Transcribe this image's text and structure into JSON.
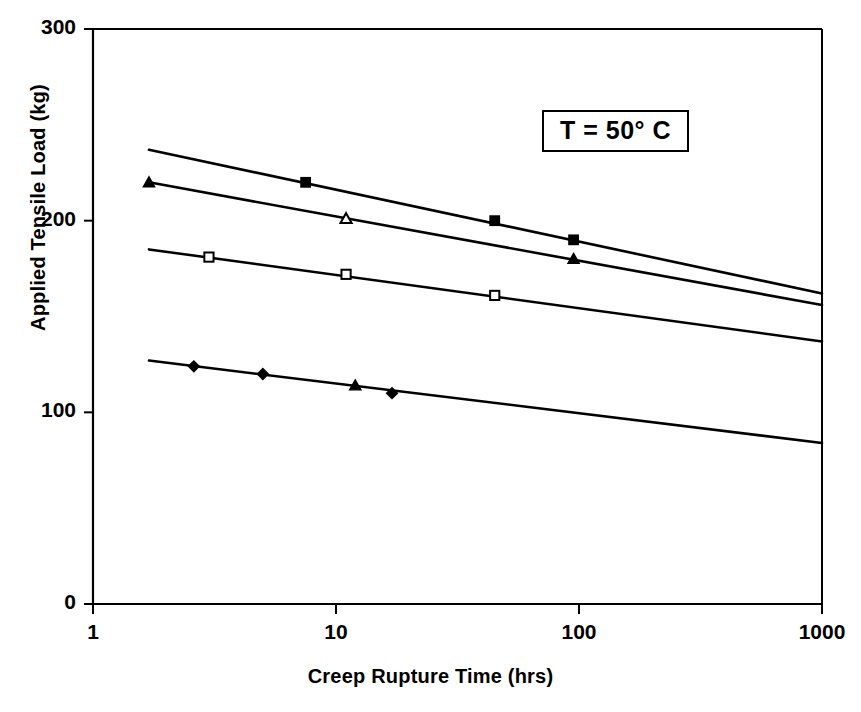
{
  "chart_data": {
    "type": "line",
    "title": "",
    "subtitle": "",
    "xlabel": "Creep Rupture Time (hrs)",
    "ylabel": "Applied Tensile Load (kg)",
    "xscale": "log",
    "yscale": "linear",
    "xlim": [
      1,
      1000
    ],
    "ylim": [
      0,
      300
    ],
    "xticks": [
      1,
      10,
      100,
      1000
    ],
    "xtick_labels": [
      "1",
      "10",
      "100",
      "1000"
    ],
    "yticks": [
      0,
      100,
      200,
      300
    ],
    "ytick_labels": [
      "0",
      "100",
      "200",
      "300"
    ],
    "grid": false,
    "legend": "none",
    "annotations": [
      {
        "name": "temperature-annotation",
        "text": "T = 50° C",
        "boxed": true,
        "x": 120,
        "y": 262
      }
    ],
    "series": [
      {
        "name": "Series 1",
        "marker": "filled-square",
        "fit_line": [
          {
            "x": 1.7,
            "y": 237
          },
          {
            "x": 1000,
            "y": 162
          }
        ],
        "points": [
          {
            "x": 7.5,
            "y": 220
          },
          {
            "x": 45,
            "y": 200
          },
          {
            "x": 95,
            "y": 190
          }
        ]
      },
      {
        "name": "Series 2",
        "marker": "open-triangle",
        "fit_line": [
          {
            "x": 1.7,
            "y": 220
          },
          {
            "x": 1000,
            "y": 156
          }
        ],
        "points": [
          {
            "x": 1.7,
            "y": 220,
            "marker": "filled-triangle"
          },
          {
            "x": 11,
            "y": 201,
            "marker": "open-triangle"
          },
          {
            "x": 95,
            "y": 180,
            "marker": "filled-triangle"
          }
        ]
      },
      {
        "name": "Series 3",
        "marker": "open-square",
        "fit_line": [
          {
            "x": 1.7,
            "y": 185
          },
          {
            "x": 1000,
            "y": 137
          }
        ],
        "points": [
          {
            "x": 3.0,
            "y": 181
          },
          {
            "x": 11,
            "y": 172
          },
          {
            "x": 45,
            "y": 161
          }
        ]
      },
      {
        "name": "Series 4",
        "marker": "filled-diamond",
        "fit_line": [
          {
            "x": 1.7,
            "y": 127
          },
          {
            "x": 1000,
            "y": 84
          }
        ],
        "points": [
          {
            "x": 2.6,
            "y": 124
          },
          {
            "x": 5.0,
            "y": 120
          },
          {
            "x": 12,
            "y": 114,
            "marker": "filled-triangle"
          },
          {
            "x": 17,
            "y": 110,
            "marker": "filled-diamond"
          }
        ]
      }
    ]
  }
}
